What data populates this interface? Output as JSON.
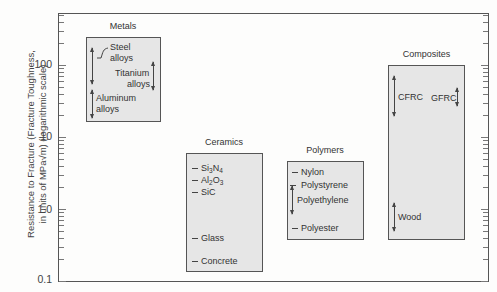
{
  "chart_data": {
    "type": "range-bar",
    "title": "",
    "ylabel": "Resistance to Fracture (Fracture Toughness, in units of MPa√m) (logarithmic scale)",
    "ylabel_line1": "Resistance to Fracture (Fracture Toughness,",
    "ylabel_line2": "in units of MPa√m) (logarithmic scale)",
    "yscale": "log",
    "ylim": [
      0.1,
      500
    ],
    "yticks": [
      "100",
      "10",
      "1.0",
      "0.1"
    ],
    "grid": false,
    "categories": [
      "Metals",
      "Ceramics",
      "Polymers",
      "Composites"
    ],
    "groups": [
      {
        "name": "Metals",
        "range": [
          16,
          240
        ],
        "items": [
          {
            "label_lines": [
              "Steel",
              "alloys"
            ],
            "range": [
              40,
              160
            ]
          },
          {
            "label_lines": [
              "Titanium",
              "alloys"
            ],
            "range": [
              44,
              100
            ]
          },
          {
            "label_lines": [
              "Aluminum",
              "alloys"
            ],
            "range": [
              20,
              45
            ]
          }
        ]
      },
      {
        "name": "Ceramics",
        "range": [
          0.15,
          6
        ],
        "items": [
          {
            "label": "Si3N4",
            "value": 4.5
          },
          {
            "label": "Al2O3",
            "value": 3.8
          },
          {
            "label": "SiC",
            "value": 3.0
          },
          {
            "label": "Glass",
            "value": 0.75
          },
          {
            "label": "Concrete",
            "value": 0.3
          }
        ]
      },
      {
        "name": "Polymers",
        "range": [
          0.4,
          4.5
        ],
        "items": [
          {
            "label": "Nylon",
            "value": 3.0
          },
          {
            "label": "Polystyrene",
            "value": 1.5
          },
          {
            "label": "Polyethylene",
            "range": [
              0.9,
              2.0
            ]
          },
          {
            "label": "Polyester",
            "value": 0.6
          }
        ]
      },
      {
        "name": "Composites",
        "range": [
          0.4,
          100
        ],
        "items": [
          {
            "label": "CFRC",
            "range": [
              20,
              70
            ]
          },
          {
            "label": "GFRC",
            "range": [
              30,
              45
            ]
          },
          {
            "label": "Wood",
            "range": [
              0.4,
              1.1
            ]
          }
        ]
      }
    ]
  },
  "groups": {
    "metals": {
      "title": "Metals",
      "steel1": "Steel",
      "steel2": "alloys",
      "ti1": "Titanium",
      "ti2": "alloys",
      "al1": "Aluminum",
      "al2": "alloys"
    },
    "ceramics": {
      "title": "Ceramics",
      "glass": "Glass",
      "concrete": "Concrete",
      "sic": "SiC"
    },
    "polymers": {
      "title": "Polymers",
      "nylon": "Nylon",
      "polystyrene": "Polystyrene",
      "polyethylene": "Polyethylene",
      "polyester": "Polyester"
    },
    "composites": {
      "title": "Composites",
      "cfrc": "CFRC",
      "gfrc": "GFRC",
      "wood": "Wood"
    }
  },
  "axis": {
    "t100": "100",
    "t10": "10",
    "t1": "1.0",
    "t01": "0.1",
    "title1": "Resistance to Fracture (Fracture Toughness,",
    "title2": "in units of MPa√m) (logarithmic scale)"
  }
}
